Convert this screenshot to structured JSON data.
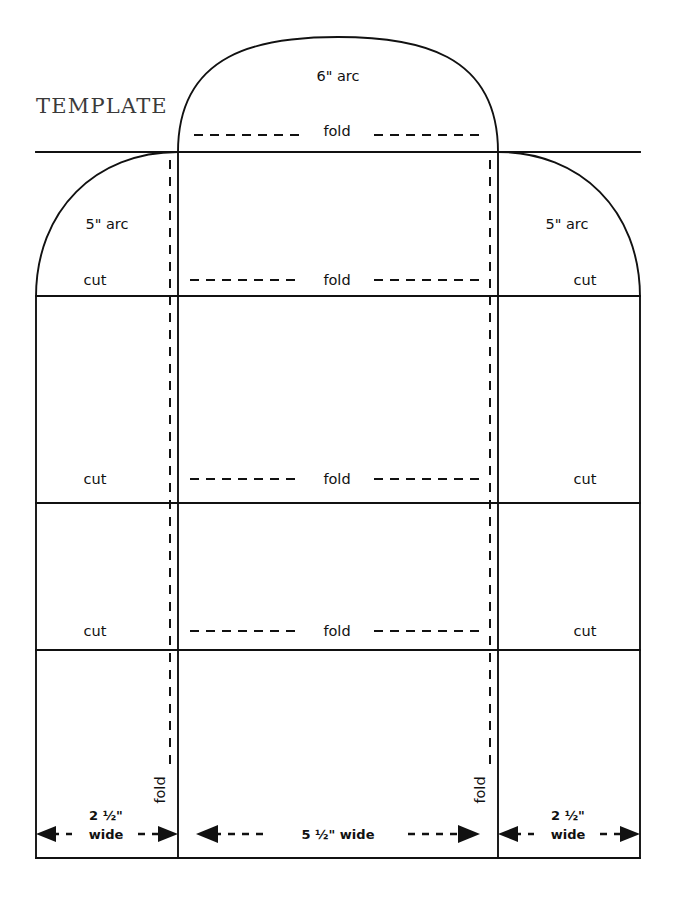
{
  "title": "TEMPLATE",
  "arcs": {
    "top_label": "6\" arc",
    "left_label": "5\" arc",
    "right_label": "5\" arc"
  },
  "folds": {
    "top": "fold",
    "row1": "fold",
    "row2": "fold",
    "row3": "fold",
    "vertical_left": "fold",
    "vertical_right": "fold"
  },
  "cuts": {
    "left_row1": "cut",
    "right_row1": "cut",
    "left_row2": "cut",
    "right_row2": "cut",
    "left_row3": "cut",
    "right_row3": "cut"
  },
  "dimensions": {
    "left_value": "2 ½\"",
    "left_unit": "wide",
    "center": "5 ½\" wide",
    "right_value": "2 ½\"",
    "right_unit": "wide"
  },
  "colors": {
    "ink": "#111111",
    "title_ink": "#3a3a3a",
    "paper": "#ffffff"
  }
}
